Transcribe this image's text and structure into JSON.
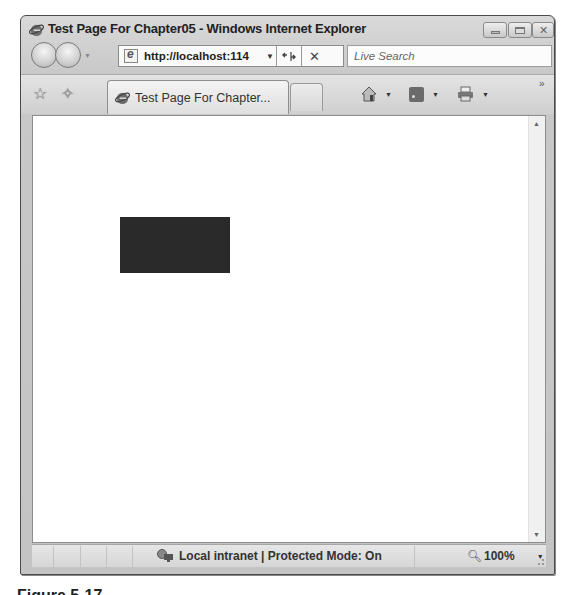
{
  "window": {
    "title": "Test Page For Chapter05 - Windows Internet Explorer",
    "controls": {
      "minimize": "minimize",
      "maximize": "maximize",
      "close": "close"
    }
  },
  "nav": {
    "address": "http://localhost:114",
    "refresh_icon": "refresh-icon",
    "stop_icon": "stop-icon",
    "stop_glyph": "✕",
    "refresh_glyph": "⁴↟",
    "search_placeholder": "Live Search"
  },
  "tabs": {
    "active_label": "Test Page For Chapter...",
    "overflow": "»"
  },
  "content": {
    "rect_color": "#2a2a2a"
  },
  "status": {
    "zone": "Local intranet | Protected Mode: On",
    "zoom_level": "100%"
  },
  "caption": "Figure 5-17"
}
